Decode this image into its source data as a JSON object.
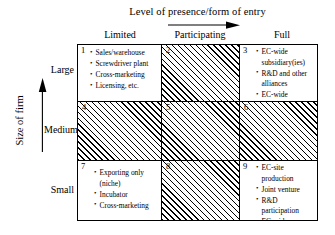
{
  "axes": {
    "x_title": "Level of presence/form of entry",
    "x_labels": [
      "Limited",
      "Participating",
      "Full"
    ],
    "y_title": "Size of firm",
    "y_labels": [
      "Large",
      "Medium",
      "Small"
    ]
  },
  "matrix": {
    "cells": [
      {
        "number": "1",
        "hatched": false,
        "items": [
          "Sales/warehouse",
          "Screwdriver plant",
          "Cross-marketing",
          "Licensing, etc."
        ]
      },
      {
        "number": "2",
        "hatched": true,
        "items": []
      },
      {
        "number": "3",
        "hatched": false,
        "items": [
          "EC-wide subsidiary(ies)",
          "R&D and other alliances",
          "EC-wide distribution"
        ]
      },
      {
        "number": "4",
        "hatched": true,
        "items": []
      },
      {
        "number": "5",
        "hatched": true,
        "items": []
      },
      {
        "number": "6",
        "hatched": true,
        "items": []
      },
      {
        "number": "7",
        "hatched": false,
        "items": [
          "Exporting only (niche)",
          "Incubator",
          "Cross-marketing"
        ]
      },
      {
        "number": "8",
        "hatched": true,
        "items": []
      },
      {
        "number": "9",
        "hatched": false,
        "items": [
          "EC-site production",
          "Joint venture",
          "R&D participation",
          "EC-wide distribution"
        ]
      }
    ]
  },
  "colors": {
    "line": "#000000",
    "background": "#ffffff",
    "hatch": "#000000"
  }
}
